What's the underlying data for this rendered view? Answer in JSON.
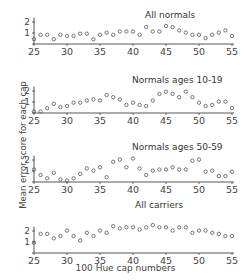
{
  "chart_data": [
    {
      "type": "scatter",
      "title": "All normals",
      "x": [
        25,
        26,
        27,
        28,
        29,
        30,
        31,
        32,
        33,
        34,
        35,
        36,
        37,
        38,
        39,
        40,
        41,
        42,
        43,
        44,
        45,
        46,
        47,
        48,
        49,
        50,
        51,
        52,
        53,
        54,
        55
      ],
      "values": [
        0.3,
        0.7,
        0.7,
        0.3,
        0.7,
        0.6,
        0.6,
        0.8,
        0.8,
        0.3,
        0.7,
        0.9,
        0.7,
        1.0,
        1.0,
        1.0,
        0.7,
        1.4,
        1.0,
        1.0,
        1.5,
        1.4,
        1.1,
        0.9,
        0.7,
        0.7,
        0.4,
        0.7,
        0.9,
        1.1,
        0.6
      ],
      "xlabel": "",
      "ylabel": "",
      "yticks": [
        1,
        2
      ],
      "xticks": [
        25,
        30,
        35,
        40,
        45,
        50,
        55
      ]
    },
    {
      "type": "scatter",
      "title": "Normals ages 10-19",
      "x": [
        25,
        26,
        27,
        28,
        29,
        30,
        31,
        32,
        33,
        34,
        35,
        36,
        37,
        38,
        39,
        40,
        41,
        42,
        43,
        44,
        45,
        46,
        47,
        48,
        49,
        50,
        51,
        52,
        53,
        54,
        55
      ],
      "values": [
        0.0,
        0.0,
        0.3,
        0.7,
        0.4,
        0.5,
        0.8,
        0.8,
        1.0,
        1.1,
        1.0,
        1.5,
        1.3,
        1.1,
        0.6,
        0.8,
        0.6,
        0.5,
        1.0,
        1.6,
        1.8,
        1.6,
        1.3,
        1.8,
        1.3,
        0.8,
        0.5,
        0.6,
        0.9,
        0.9,
        0.3
      ],
      "yticks": [
        1,
        2
      ],
      "xticks": [
        25,
        30,
        35,
        40,
        45,
        50,
        55
      ]
    },
    {
      "type": "scatter",
      "title": "Normals ages 50-59",
      "x": [
        25,
        26,
        27,
        28,
        29,
        30,
        31,
        32,
        33,
        34,
        35,
        36,
        37,
        38,
        39,
        40,
        41,
        42,
        43,
        44,
        45,
        46,
        47,
        48,
        49,
        50,
        51,
        52,
        53,
        54,
        55
      ],
      "values": [
        1.0,
        0.5,
        0.2,
        0.7,
        0.1,
        0.0,
        0.2,
        0.6,
        1.1,
        0.9,
        1.2,
        0.3,
        1.7,
        1.9,
        1.2,
        2.0,
        1.1,
        0.5,
        0.9,
        1.0,
        1.0,
        1.2,
        1.0,
        1.0,
        1.8,
        1.9,
        0.8,
        0.9,
        0.4,
        0.4,
        0.8
      ],
      "yticks": [
        1,
        2
      ],
      "xticks": [
        25,
        30,
        35,
        40,
        45,
        50,
        55
      ]
    },
    {
      "type": "scatter",
      "title": "All carriers",
      "x": [
        25,
        26,
        27,
        28,
        29,
        30,
        31,
        32,
        33,
        34,
        35,
        36,
        37,
        38,
        39,
        40,
        41,
        42,
        43,
        44,
        45,
        46,
        47,
        48,
        49,
        50,
        51,
        52,
        53,
        54,
        55
      ],
      "values": [
        0.8,
        1.6,
        1.6,
        1.2,
        1.4,
        1.9,
        1.4,
        1.0,
        1.7,
        1.4,
        1.9,
        1.7,
        2.3,
        2.1,
        2.2,
        2.2,
        2.0,
        2.2,
        2.4,
        2.2,
        2.2,
        1.9,
        2.2,
        2.2,
        1.7,
        1.9,
        1.9,
        1.7,
        1.6,
        1.4,
        1.4
      ],
      "xlabel": "100 Hue cap numbers",
      "yticks": [
        1,
        2
      ],
      "xticks": [
        25,
        30,
        35,
        40,
        45,
        50,
        55
      ]
    }
  ],
  "labels": {
    "ylabel": "Mean error score for each cap",
    "xlabel": "100 Hue cap numbers"
  },
  "panels": [
    {
      "title": "All normals",
      "baseline": 44,
      "title_x": 145,
      "title_y": 18
    },
    {
      "title": "Normals ages 10-19",
      "baseline": 113,
      "title_x": 132,
      "title_y": 83
    },
    {
      "title": "Normals ages 50-59",
      "baseline": 182,
      "title_x": 132,
      "title_y": 150
    },
    {
      "title": "All carriers",
      "baseline": 253,
      "title_x": 135,
      "title_y": 208
    }
  ]
}
